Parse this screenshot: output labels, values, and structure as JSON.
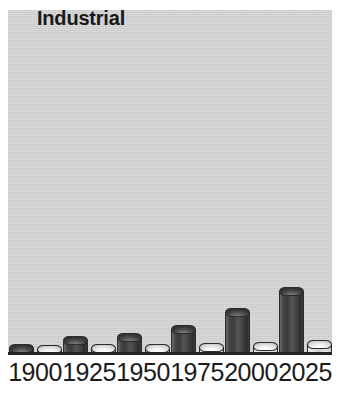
{
  "chart_data": {
    "type": "bar",
    "title": "Industrial",
    "subtitle": "",
    "xlabel": "",
    "ylabel": "",
    "categories": [
      "1900",
      "1925",
      "1950",
      "1975",
      "2000",
      "2025"
    ],
    "series": [
      {
        "name": "dark-series",
        "values": [
          5,
          13,
          16,
          24,
          41,
          62
        ]
      },
      {
        "name": "light-series",
        "values": [
          4,
          5,
          5,
          6,
          7,
          9
        ]
      }
    ],
    "ylim": [
      0,
      70
    ],
    "grid": false,
    "legend": "none",
    "style": "3d-cylinder",
    "colors": {
      "panel_background": "#d5d5d5",
      "dark_series": "#3a3a3a",
      "light_series": "#e8e8e8",
      "axis": "#222222",
      "text": "#1b1b1b"
    }
  },
  "chart": {
    "title": "Industrial",
    "ticks": [
      {
        "label": "1900"
      },
      {
        "label": "1925"
      },
      {
        "label": "1950"
      },
      {
        "label": "1975"
      },
      {
        "label": "2000"
      },
      {
        "label": "2025"
      }
    ]
  }
}
